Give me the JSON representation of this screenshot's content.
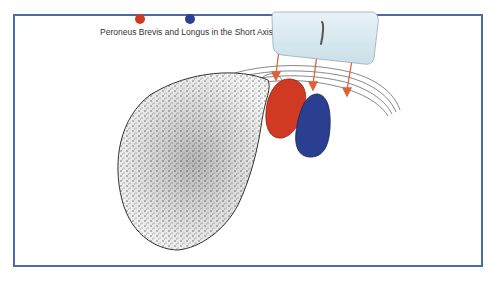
{
  "diagram": {
    "caption": "Peroneus Brevis and Longus in the Short Axis",
    "legend": [
      {
        "name": "peroneus-brevis",
        "color": "#d13a22"
      },
      {
        "name": "peroneus-longus",
        "color": "#2a3f8f"
      }
    ],
    "colors": {
      "frame_border": "#4a6aa8",
      "brevis": "#d13a22",
      "longus": "#2a3f8f",
      "arrow": "#e0603a",
      "probe": "#d9eaf0"
    },
    "elements": [
      "ultrasound-probe",
      "ultrasound-beam-arrows",
      "fibula-bone",
      "retinaculum",
      "peroneus-brevis-tendon",
      "peroneus-longus-tendon"
    ]
  }
}
